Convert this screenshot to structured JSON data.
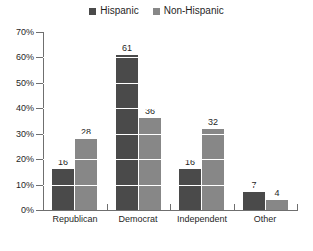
{
  "chart_data": {
    "type": "bar",
    "title": "",
    "subtitle": "",
    "xlabel": "",
    "ylabel": "",
    "categories": [
      "Republican",
      "Democrat",
      "Independent",
      "Other"
    ],
    "series": [
      {
        "name": "Hispanic",
        "color": "#4a4a4a",
        "values": [
          16,
          61,
          16,
          7
        ]
      },
      {
        "name": "Non-Hispanic",
        "color": "#878787",
        "values": [
          28,
          36,
          32,
          4
        ]
      }
    ],
    "ylim": [
      0,
      70
    ],
    "ytick_values": [
      0,
      10,
      20,
      30,
      40,
      50,
      60,
      70
    ],
    "ytick_labels": [
      "0%",
      "10%",
      "20%",
      "30%",
      "40%",
      "50%",
      "60%",
      "70%"
    ],
    "grid": true,
    "grid_color": "#ffffff",
    "grid_axis": "y",
    "legend_position": "top-center",
    "value_labels": true,
    "background": "#ffffff",
    "axis_color": "#6f6f6f"
  },
  "legend": {
    "entries": [
      {
        "label": "Hispanic",
        "swatch": "legend-swatch-hispanic"
      },
      {
        "label": "Non-Hispanic",
        "swatch": "legend-swatch-non-hispanic"
      }
    ]
  }
}
